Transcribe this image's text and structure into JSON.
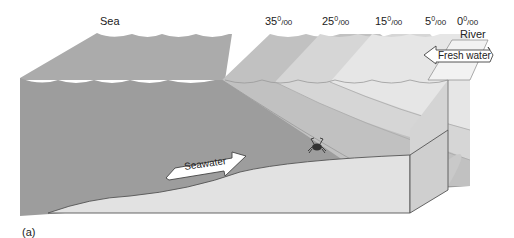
{
  "figure": {
    "panel_label": "(a)",
    "sea_label": "Sea",
    "river_label": "River",
    "salinity_labels": [
      {
        "value": "35",
        "unit": "0/00"
      },
      {
        "value": "25",
        "unit": "0/00"
      },
      {
        "value": "15",
        "unit": "0/00"
      },
      {
        "value": "5",
        "unit": "0/00"
      },
      {
        "value": "0",
        "unit": "0/00"
      }
    ],
    "arrows": {
      "fresh_water": "Fresh water",
      "seawater": "Seawater"
    },
    "colors": {
      "sea_top": "#a9a9a9",
      "sea_front": "#9d9d9d",
      "layer_25": "#c3c3c3",
      "layer_15": "#d8d8d8",
      "layer_5": "#e6e6e6",
      "layer_0": "#f0f0f0",
      "seabed": "#e2e2e2",
      "seabed_side": "#d0d0d0",
      "outline": "#555555"
    }
  }
}
